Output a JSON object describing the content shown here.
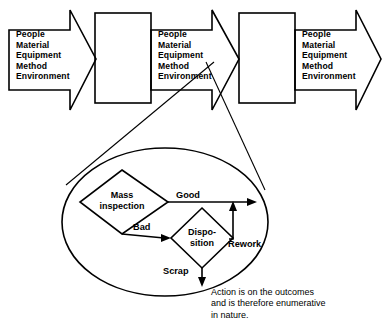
{
  "diagram": {
    "stroke_color": "#000000",
    "background_color": "#ffffff",
    "inputs_block_text": "People\nMaterial\nEquipment\nMethod\nEnvironment",
    "input_arrows": [
      {
        "id": "inputs-arrow-1",
        "text": "People\nMaterial\nEquipment\nMethod\nEnvironment"
      },
      {
        "id": "inputs-arrow-2",
        "text": "People\nMaterial\nEquipment\nMethod\nEnvironment"
      },
      {
        "id": "inputs-arrow-3",
        "text": "People\nMaterial\nEquipment\nMethod\nEnvironment"
      }
    ],
    "process_boxes": [
      {
        "id": "process-box-1",
        "label": ""
      },
      {
        "id": "process-box-2",
        "label": ""
      }
    ],
    "detail": {
      "inspection_node": "Mass\ninspection",
      "disposition_node": "Dispo-\nsition",
      "edges": {
        "good": "Good",
        "bad": "Bad",
        "rework": "Rework",
        "scrap": "Scrap"
      }
    },
    "caption": "Action is on the outcomes\nand is therefore enumerative\nin nature."
  }
}
